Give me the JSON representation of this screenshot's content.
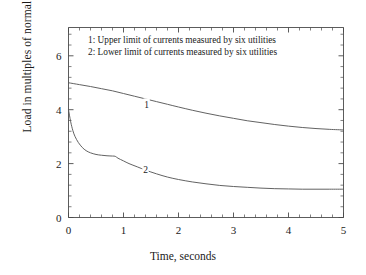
{
  "chart_data": {
    "type": "line",
    "title": "",
    "xlabel": "Time, seconds",
    "ylabel": "Load in multiples of normal peak current",
    "xlim": [
      0,
      5
    ],
    "ylim": [
      0,
      7.05
    ],
    "grid": false,
    "legend_position": "inside-top-left",
    "x_ticks": [
      {
        "value": 0,
        "label": "0"
      },
      {
        "value": 1,
        "label": "1"
      },
      {
        "value": 2,
        "label": "2"
      },
      {
        "value": 3,
        "label": "3"
      },
      {
        "value": 4,
        "label": "4"
      },
      {
        "value": 5,
        "label": "5"
      }
    ],
    "x_minor_step": 0.2,
    "y_ticks": [
      {
        "value": 0,
        "label": "0"
      },
      {
        "value": 2,
        "label": "2"
      },
      {
        "value": 4,
        "label": "4"
      },
      {
        "value": 6,
        "label": "6"
      }
    ],
    "y_minor_step": 0.4,
    "annotations": [
      {
        "text": "1",
        "x": 1.42,
        "y": 4.18,
        "name": "curve-1-inline-label"
      },
      {
        "text": "2",
        "x": 1.4,
        "y": 1.78,
        "name": "curve-2-inline-label"
      }
    ],
    "legend_entries": [
      "1: Upper limit of currents measured by six utilities",
      "2: Lower limit of currents measured by six utilities"
    ],
    "series": [
      {
        "name": "1",
        "label": "Upper limit of currents measured by six utilities",
        "color": "#5a5a5a",
        "points": [
          [
            0.0,
            5.0
          ],
          [
            0.2,
            4.93
          ],
          [
            0.4,
            4.86
          ],
          [
            0.6,
            4.78
          ],
          [
            0.8,
            4.7
          ],
          [
            1.0,
            4.6
          ],
          [
            1.2,
            4.5
          ],
          [
            1.4,
            4.4
          ],
          [
            1.6,
            4.3
          ],
          [
            1.8,
            4.2
          ],
          [
            2.0,
            4.1
          ],
          [
            2.25,
            3.98
          ],
          [
            2.5,
            3.87
          ],
          [
            2.75,
            3.77
          ],
          [
            3.0,
            3.68
          ],
          [
            3.25,
            3.59
          ],
          [
            3.5,
            3.52
          ],
          [
            3.75,
            3.45
          ],
          [
            4.0,
            3.39
          ],
          [
            4.25,
            3.34
          ],
          [
            4.5,
            3.3
          ],
          [
            4.75,
            3.27
          ],
          [
            5.0,
            3.25
          ]
        ]
      },
      {
        "name": "2",
        "label": "Lower limit of currents measured by six utilities",
        "color": "#5a5a5a",
        "points": [
          [
            0.0,
            4.0
          ],
          [
            0.04,
            3.55
          ],
          [
            0.08,
            3.22
          ],
          [
            0.12,
            3.0
          ],
          [
            0.18,
            2.78
          ],
          [
            0.25,
            2.6
          ],
          [
            0.32,
            2.48
          ],
          [
            0.4,
            2.4
          ],
          [
            0.5,
            2.34
          ],
          [
            0.6,
            2.31
          ],
          [
            0.7,
            2.29
          ],
          [
            0.8,
            2.28
          ],
          [
            0.85,
            2.27
          ],
          [
            0.9,
            2.2
          ],
          [
            1.0,
            2.1
          ],
          [
            1.1,
            2.0
          ],
          [
            1.25,
            1.88
          ],
          [
            1.4,
            1.76
          ],
          [
            1.6,
            1.62
          ],
          [
            1.8,
            1.5
          ],
          [
            2.0,
            1.41
          ],
          [
            2.25,
            1.32
          ],
          [
            2.5,
            1.25
          ],
          [
            2.75,
            1.19
          ],
          [
            3.0,
            1.15
          ],
          [
            3.25,
            1.12
          ],
          [
            3.5,
            1.09
          ],
          [
            3.75,
            1.07
          ],
          [
            4.0,
            1.06
          ],
          [
            4.25,
            1.05
          ],
          [
            4.5,
            1.05
          ],
          [
            4.75,
            1.05
          ],
          [
            5.0,
            1.05
          ]
        ]
      }
    ]
  },
  "axes": {
    "x_title": "Time, seconds",
    "y_title": "Load in multiples of normal peak current"
  }
}
